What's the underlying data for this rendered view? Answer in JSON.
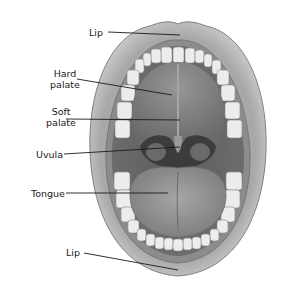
{
  "diagram": {
    "labels": [
      {
        "id": "lip-top",
        "text": "Lip"
      },
      {
        "id": "hard-palate",
        "line1": "Hard",
        "line2": "palate"
      },
      {
        "id": "soft-palate",
        "line1": "Soft",
        "line2": "palate"
      },
      {
        "id": "uvula",
        "text": "Uvula"
      },
      {
        "id": "tongue",
        "text": "Tongue"
      },
      {
        "id": "lip-bottom",
        "text": "Lip"
      }
    ]
  },
  "colors": {
    "background": "#ffffff",
    "lip": "#b9b9b9",
    "lip_shadow": "#8a8a8a",
    "teeth": "#eeeeee",
    "palate": "#7a7a7a",
    "throat": "#3a3a3a",
    "tongue": "#9a9a9a",
    "leader_line": "#1a1a1a"
  }
}
